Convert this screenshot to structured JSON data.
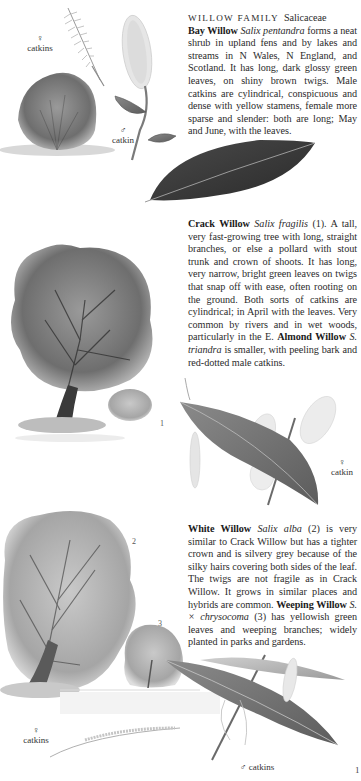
{
  "family_heading": {
    "caps": "WILLOW FAMILY",
    "latin": "Salicaceae"
  },
  "species": [
    {
      "id": "bay-willow",
      "name": "Bay Willow",
      "latin": "Salix pentandra",
      "text": " forms a neat shrub in upland fens and by lakes and streams in N Wales, N England, and Scotland. It has long, dark glossy green leaves, on shiny brown twigs. Male catkins are cylindrical, conspicuous and dense with yellow stamens, female more sparse and slender: both are long; May and June, with the leaves."
    },
    {
      "id": "crack-willow",
      "name": "Crack Willow",
      "latin": "Salix fragilis",
      "ref": " (1)",
      "text": ". A tall, very fast-growing tree with long, straight branches, or else a pollard with stout trunk and crown of shoots. It has long, very narrow, bright green leaves on twigs that snap off with ease, often rooting on the ground. Both sorts of catkins are cylindrical; in April with the leaves. Very common by rivers and in wet woods, particularly in the E. ",
      "sub_name": "Almond Willow",
      "sub_latin": "S. triandra",
      "sub_text": " is smaller, with peeling bark and red-dotted male catkins."
    },
    {
      "id": "white-willow",
      "name": "White Willow",
      "latin": "Salix alba",
      "ref": " (2)",
      "text": " is very similar to Crack Willow but has a tighter crown and is silvery grey because of the silky hairs covering both sides of the leaf. The twigs are not fragile as in Crack Willow. It grows in similar places and hybrids are common. ",
      "sub_name": "Weeping Willow",
      "sub_latin": "S. × chrysocoma",
      "sub_ref": " (3)",
      "sub_text": " has yellowish green leaves and weeping branches; widely planted in parks and gardens."
    }
  ],
  "labels": {
    "bay_female": {
      "symbol": "♀",
      "text": "catkins"
    },
    "bay_male": {
      "symbol": "♂",
      "text": "catkin"
    },
    "crack_female": {
      "symbol": "♀",
      "text": "catkin"
    },
    "white_female": {
      "symbol": "♀",
      "text": "catkins"
    },
    "white_male": {
      "symbol": "♂",
      "text": "catkins"
    }
  },
  "figure_numbers": {
    "crack": "1",
    "white": "2",
    "weeping": "3"
  },
  "page_number": "1"
}
